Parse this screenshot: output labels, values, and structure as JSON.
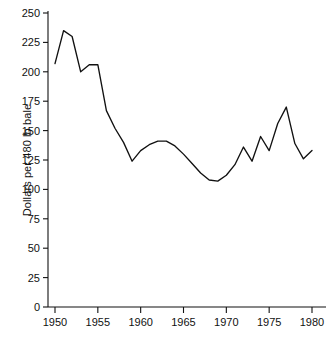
{
  "chart_data": {
    "type": "line",
    "title": "",
    "subtitle": "",
    "xlabel": "",
    "ylabel": "Dollars per 480 lb bale",
    "xlim": [
      1949,
      1981
    ],
    "ylim": [
      0,
      250
    ],
    "grid": false,
    "legend": false,
    "legend_position": "none",
    "line_color": "#111111",
    "background_color": "#ffffff",
    "x": [
      1950,
      1951,
      1952,
      1953,
      1954,
      1955,
      1956,
      1957,
      1958,
      1959,
      1960,
      1961,
      1962,
      1963,
      1964,
      1965,
      1966,
      1967,
      1968,
      1969,
      1970,
      1971,
      1972,
      1973,
      1974,
      1975,
      1976,
      1977,
      1978,
      1979,
      1980
    ],
    "values": [
      207,
      235,
      230,
      200,
      206,
      206,
      167,
      152,
      140,
      124,
      133,
      138,
      141,
      141,
      137,
      130,
      122,
      114,
      108,
      107,
      112,
      121,
      136,
      124,
      145,
      133,
      156,
      170,
      139,
      126,
      133
    ],
    "series": [
      {
        "name": "Dollars per 480 lb bale",
        "values": [
          207,
          235,
          230,
          200,
          206,
          206,
          167,
          152,
          140,
          124,
          133,
          138,
          141,
          141,
          137,
          130,
          122,
          114,
          108,
          107,
          112,
          121,
          136,
          124,
          145,
          133,
          156,
          170,
          139,
          126,
          133
        ]
      }
    ],
    "xticks": [
      1950,
      1955,
      1960,
      1965,
      1970,
      1975,
      1980
    ],
    "xticklabels": [
      "1950",
      "1955",
      "1960",
      "1965",
      "1970",
      "1975",
      "1980"
    ],
    "yticks": [
      0,
      25,
      50,
      75,
      100,
      125,
      150,
      175,
      200,
      225,
      250
    ],
    "yticklabels": [
      "0",
      "25",
      "50",
      "75",
      "100",
      "125",
      "150",
      "175",
      "200",
      "225",
      "250"
    ]
  },
  "axes": {
    "y_axis_title": "Dollars per 480 lb bale"
  }
}
